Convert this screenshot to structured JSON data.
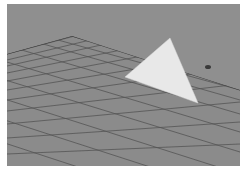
{
  "viewport": {
    "label": "3D perspective viewport",
    "background_color": "#8e8e8e",
    "grid": {
      "plane_color": "#8a8a8a",
      "line_color": "#4a4a4a",
      "description": "Ground-plane grid shown in perspective"
    },
    "object": {
      "type": "triangle",
      "fill_color": "#e6e6e6",
      "description": "Single flat triangle polygon above the grid"
    },
    "manipulator": {
      "description": "small dark manipulator handle"
    }
  }
}
